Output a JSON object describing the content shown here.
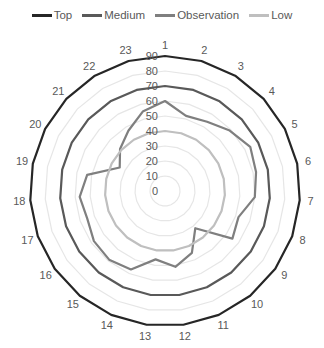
{
  "chart_data": {
    "type": "radar",
    "title": "",
    "categories": [
      "1",
      "2",
      "3",
      "4",
      "5",
      "6",
      "7",
      "8",
      "9",
      "10",
      "11",
      "12",
      "13",
      "14",
      "15",
      "16",
      "17",
      "18",
      "19",
      "20",
      "21",
      "22",
      "23"
    ],
    "series": [
      {
        "name": "Top",
        "color": "#262626",
        "width": 2.2,
        "values": [
          90,
          90,
          90,
          90,
          90,
          90,
          90,
          90,
          90,
          90,
          90,
          90,
          90,
          90,
          90,
          90,
          90,
          90,
          90,
          90,
          90,
          90,
          90
        ]
      },
      {
        "name": "Medium",
        "color": "#595959",
        "width": 2.2,
        "values": [
          70,
          70,
          70,
          70,
          70,
          70,
          70,
          70,
          70,
          70,
          70,
          70,
          70,
          70,
          70,
          70,
          70,
          70,
          70,
          70,
          70,
          70,
          70
        ]
      },
      {
        "name": "Observation",
        "color": "#7f7f7f",
        "width": 2.2,
        "values": [
          60,
          52,
          54,
          59,
          64,
          62,
          60,
          52,
          55,
          32,
          45,
          51,
          46,
          57,
          59,
          58,
          55,
          57,
          53,
          34,
          41,
          47,
          55
        ]
      },
      {
        "name": "Low",
        "color": "#bfbfbf",
        "width": 2.2,
        "values": [
          40,
          40,
          40,
          40,
          40,
          40,
          40,
          40,
          40,
          40,
          40,
          40,
          40,
          40,
          40,
          40,
          40,
          40,
          40,
          40,
          40,
          40,
          40
        ]
      }
    ],
    "radial_axis": {
      "min": 0,
      "max": 90,
      "step": 10,
      "tick_labels": [
        "0",
        "10",
        "20",
        "30",
        "40",
        "50",
        "60",
        "70",
        "80",
        "90"
      ]
    },
    "grid": true,
    "legend_position": "top",
    "colors": {
      "grid": "#e6e6e6",
      "text": "#595959"
    }
  }
}
